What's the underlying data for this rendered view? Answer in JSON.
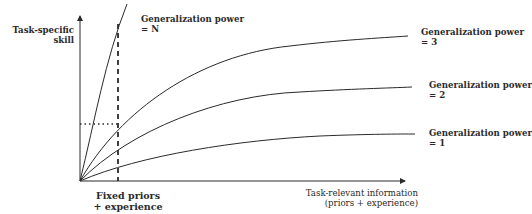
{
  "diagram": {
    "y_axis_label": [
      "Task-specific",
      "skill"
    ],
    "x_axis_label": [
      "Task-relevant information",
      "(priors + experience)"
    ],
    "marker_label": [
      "Fixed priors",
      "+ experience"
    ],
    "curves": [
      {
        "name": "gp-n",
        "label": [
          "Generalization power",
          "= N"
        ]
      },
      {
        "name": "gp-3",
        "label": [
          "Generalization power",
          "= 3"
        ]
      },
      {
        "name": "gp-2",
        "label": [
          "Generalization power",
          "= 2"
        ]
      },
      {
        "name": "gp-1",
        "label": [
          "Generalization power",
          "= 1"
        ]
      }
    ],
    "colors": {
      "line": "#2a2a2a",
      "background": "#ffffff"
    }
  }
}
